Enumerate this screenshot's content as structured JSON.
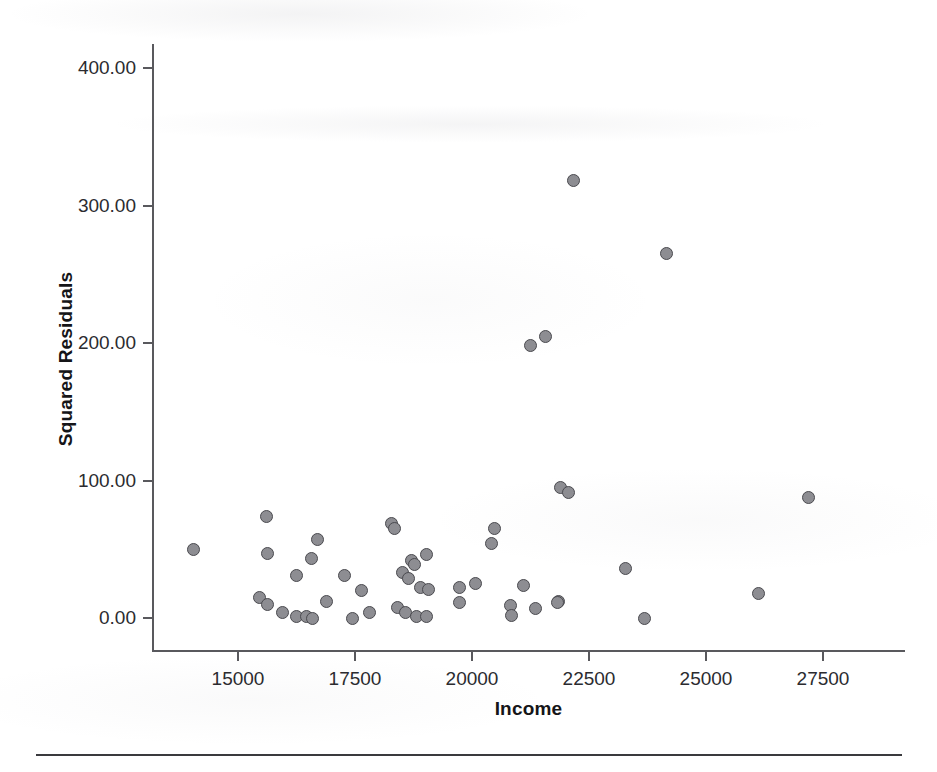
{
  "figure": {
    "background_color": "#ffffff",
    "marker_fill_color": "#8d8d92",
    "marker_edge_color": "#4a4a4f",
    "axis_color": "#59595d"
  },
  "axes": {
    "x_title": "Income",
    "y_title": "Squared Residuals",
    "x_tick_labels": [
      "15000",
      "17500",
      "20000",
      "22500",
      "25000",
      "27500"
    ],
    "y_tick_labels": [
      "0.00",
      "100.00",
      "200.00",
      "300.00",
      "400.00"
    ]
  },
  "chart_data": {
    "type": "scatter",
    "title": "",
    "xlabel": "Income",
    "ylabel": "Squared Residuals",
    "xlim": [
      13200,
      28600
    ],
    "ylim": [
      -22,
      420
    ],
    "xticks": [
      15000,
      17500,
      20000,
      22500,
      25000,
      27500
    ],
    "yticks": [
      0,
      100,
      200,
      300,
      400
    ],
    "xtick_labels": [
      "15000",
      "17500",
      "20000",
      "22500",
      "25000",
      "27500"
    ],
    "ytick_labels": [
      "0.00",
      "100.00",
      "200.00",
      "300.00",
      "400.00"
    ],
    "grid": false,
    "legend": null,
    "marker": "circle",
    "points": [
      {
        "x": 14040,
        "y": 50
      },
      {
        "x": 15600,
        "y": 74
      },
      {
        "x": 15620,
        "y": 47
      },
      {
        "x": 16690,
        "y": 57
      },
      {
        "x": 16560,
        "y": 43
      },
      {
        "x": 16240,
        "y": 31
      },
      {
        "x": 15470,
        "y": 15
      },
      {
        "x": 15640,
        "y": 10
      },
      {
        "x": 15960,
        "y": 4
      },
      {
        "x": 16260,
        "y": 1
      },
      {
        "x": 16470,
        "y": 1
      },
      {
        "x": 16600,
        "y": 0
      },
      {
        "x": 16890,
        "y": 12
      },
      {
        "x": 17280,
        "y": 31
      },
      {
        "x": 17450,
        "y": 0
      },
      {
        "x": 17630,
        "y": 20
      },
      {
        "x": 17800,
        "y": 4
      },
      {
        "x": 18270,
        "y": 69
      },
      {
        "x": 18340,
        "y": 65
      },
      {
        "x": 18710,
        "y": 42
      },
      {
        "x": 19030,
        "y": 46
      },
      {
        "x": 18780,
        "y": 39
      },
      {
        "x": 18520,
        "y": 33
      },
      {
        "x": 18650,
        "y": 29
      },
      {
        "x": 18900,
        "y": 22
      },
      {
        "x": 19060,
        "y": 21
      },
      {
        "x": 19730,
        "y": 22
      },
      {
        "x": 18400,
        "y": 8
      },
      {
        "x": 18570,
        "y": 4
      },
      {
        "x": 18820,
        "y": 1
      },
      {
        "x": 19030,
        "y": 1
      },
      {
        "x": 19730,
        "y": 11
      },
      {
        "x": 20070,
        "y": 25
      },
      {
        "x": 20420,
        "y": 54
      },
      {
        "x": 20480,
        "y": 65
      },
      {
        "x": 20820,
        "y": 9
      },
      {
        "x": 20840,
        "y": 2
      },
      {
        "x": 21100,
        "y": 24
      },
      {
        "x": 21360,
        "y": 7
      },
      {
        "x": 21840,
        "y": 12
      },
      {
        "x": 21260,
        "y": 198
      },
      {
        "x": 21560,
        "y": 205
      },
      {
        "x": 22170,
        "y": 318
      },
      {
        "x": 21890,
        "y": 95
      },
      {
        "x": 22060,
        "y": 91
      },
      {
        "x": 23290,
        "y": 36
      },
      {
        "x": 21820,
        "y": 11
      },
      {
        "x": 23690,
        "y": 0
      },
      {
        "x": 24150,
        "y": 265
      },
      {
        "x": 26120,
        "y": 18
      },
      {
        "x": 27190,
        "y": 88
      }
    ]
  }
}
